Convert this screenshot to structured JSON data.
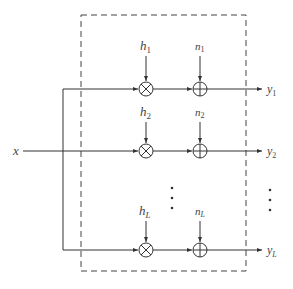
{
  "diagram": {
    "input_label": "x",
    "rows": [
      {
        "gain": "h",
        "gain_sub": "1",
        "noise": "n",
        "noise_sub": "1",
        "output": "y",
        "output_sub": "1"
      },
      {
        "gain": "h",
        "gain_sub": "2",
        "noise": "n",
        "noise_sub": "2",
        "output": "y",
        "output_sub": "2"
      },
      {
        "gain": "h",
        "gain_sub": "L",
        "noise": "n",
        "noise_sub": "L",
        "output": "y",
        "output_sub": "L"
      }
    ],
    "multiplier_symbol": "multiply-node",
    "adder_symbol": "sum-node",
    "ellipsis": "⋮",
    "colors": {
      "line": "#333333",
      "text": "#444444"
    }
  }
}
